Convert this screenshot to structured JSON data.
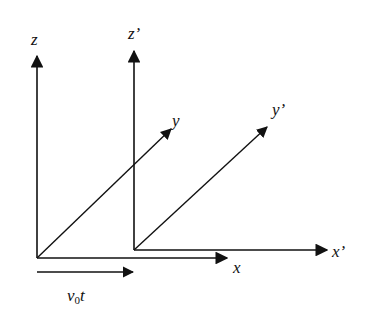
{
  "diagram": {
    "title": "",
    "type": "coordinate-frames",
    "line_color": "#111111",
    "frames": [
      {
        "name": "S",
        "origin": [
          37,
          258
        ],
        "axes": [
          {
            "name": "x",
            "label": "x",
            "end": [
              228,
              258
            ]
          },
          {
            "name": "y",
            "label": "y",
            "end": [
              172,
              128
            ]
          },
          {
            "name": "z",
            "label": "z",
            "end": [
              37,
              55
            ]
          }
        ]
      },
      {
        "name": "S'",
        "origin": [
          134,
          250
        ],
        "axes": [
          {
            "name": "x'",
            "label": "x’",
            "end": [
              328,
              250
            ]
          },
          {
            "name": "y'",
            "label": "y’",
            "end": [
              268,
              126
            ]
          },
          {
            "name": "z'",
            "label": "z’",
            "end": [
              134,
              50
            ]
          }
        ]
      }
    ],
    "displacement": {
      "label_main": "v",
      "label_sub": "0",
      "label_tail": "t",
      "start": [
        37,
        272
      ],
      "end": [
        134,
        272
      ]
    }
  }
}
